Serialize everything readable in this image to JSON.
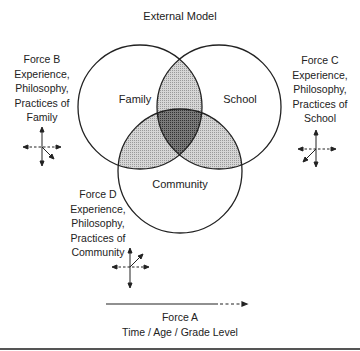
{
  "title": "External Model",
  "circles": {
    "family": "Family",
    "school": "School",
    "community": "Community"
  },
  "forces": {
    "b": {
      "name": "Force B",
      "lines": [
        "Experience,",
        "Philosophy,",
        "Practices of",
        "Family"
      ]
    },
    "c": {
      "name": "Force C",
      "lines": [
        "Experience,",
        "Philosophy,",
        "Practices of",
        "School"
      ]
    },
    "d": {
      "name": "Force D",
      "lines": [
        "Experience,",
        "Philosophy,",
        "Practices of",
        "Community"
      ]
    },
    "a": {
      "name": "Force A",
      "caption": "Time / Age / Grade Level"
    }
  },
  "colors": {
    "stroke": "#222222",
    "pair_overlap": "#c8c8c8",
    "triple_overlap": "#6e6e6e"
  }
}
